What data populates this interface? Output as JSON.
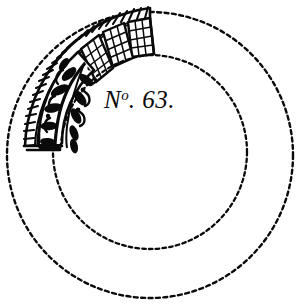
{
  "plate": {
    "title": "No. 63.",
    "label_prefix": "N",
    "label_superscript": "o",
    "label_period_after_prefix": ".",
    "label_number": "63",
    "label_terminal_period": ".",
    "background_color": "#ffffff",
    "ink_color": "#0a0a0a",
    "width_px": 299,
    "height_px": 304
  },
  "geometry": {
    "outer_circle": {
      "cx": 150,
      "cy": 155,
      "r": 143,
      "style": "dashed"
    },
    "inner_circle": {
      "cx": 150,
      "cy": 152,
      "r": 97,
      "style": "dashed"
    },
    "dash_pattern": "4 3",
    "dash_width": 2.4,
    "fragment_arc_start_deg": 182,
    "fragment_arc_end_deg": 283
  },
  "fragment": {
    "name": "ornamented ring fragment",
    "bands": [
      {
        "name": "rope-twist-border",
        "description": "outer cable twist with diagonal hatching"
      },
      {
        "name": "lattice-panels",
        "description": "three trapezoidal grid panels",
        "count": 3
      },
      {
        "name": "foliate-panel",
        "description": "dark panel with vine and leaf scroll"
      },
      {
        "name": "inner-beaded-edge",
        "description": "fine beaded inner rim"
      }
    ]
  }
}
